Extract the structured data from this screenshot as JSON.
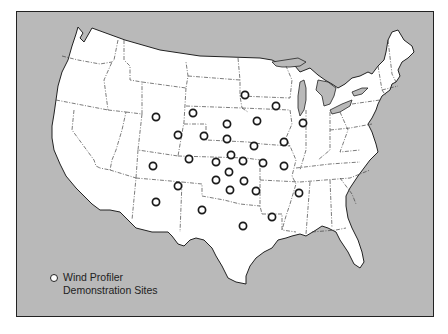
{
  "map": {
    "frame_color": "#b9b9b9",
    "land_color": "#ffffff",
    "border_color": "#222222",
    "sites": [
      {
        "x": 245,
        "y": 95
      },
      {
        "x": 276,
        "y": 106
      },
      {
        "x": 193,
        "y": 113
      },
      {
        "x": 156,
        "y": 117
      },
      {
        "x": 227,
        "y": 124
      },
      {
        "x": 257,
        "y": 121
      },
      {
        "x": 303,
        "y": 123
      },
      {
        "x": 178,
        "y": 135
      },
      {
        "x": 204,
        "y": 136
      },
      {
        "x": 227,
        "y": 139
      },
      {
        "x": 254,
        "y": 146
      },
      {
        "x": 284,
        "y": 142
      },
      {
        "x": 231,
        "y": 155
      },
      {
        "x": 216,
        "y": 162
      },
      {
        "x": 243,
        "y": 161
      },
      {
        "x": 263,
        "y": 163
      },
      {
        "x": 284,
        "y": 166
      },
      {
        "x": 189,
        "y": 159
      },
      {
        "x": 153,
        "y": 166
      },
      {
        "x": 229,
        "y": 172
      },
      {
        "x": 216,
        "y": 180
      },
      {
        "x": 244,
        "y": 181
      },
      {
        "x": 178,
        "y": 186
      },
      {
        "x": 230,
        "y": 190
      },
      {
        "x": 256,
        "y": 191
      },
      {
        "x": 299,
        "y": 193
      },
      {
        "x": 156,
        "y": 202
      },
      {
        "x": 202,
        "y": 210
      },
      {
        "x": 272,
        "y": 217
      },
      {
        "x": 243,
        "y": 226
      }
    ]
  },
  "legend": {
    "line1": "Wind Profiler",
    "line2": "Demonstration Sites"
  }
}
